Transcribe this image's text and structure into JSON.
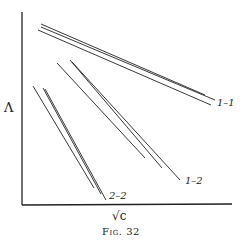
{
  "figure": {
    "caption": "Fig. 32",
    "y_axis_label": "Λ",
    "x_axis_label": "√c"
  },
  "groups": [
    {
      "label": "1–1",
      "lines": [
        [
          41,
          24,
          205,
          95
        ],
        [
          41,
          27,
          215,
          100
        ],
        [
          38,
          30,
          211,
          105
        ]
      ]
    },
    {
      "label": "1–2",
      "lines": [
        [
          57,
          63,
          145,
          158
        ],
        [
          70,
          60,
          162,
          168
        ],
        [
          72,
          62,
          180,
          180
        ]
      ]
    },
    {
      "label": "2–2",
      "lines": [
        [
          33,
          86,
          94,
          188
        ],
        [
          43,
          88,
          101,
          194
        ],
        [
          45,
          89,
          106,
          200
        ]
      ]
    }
  ],
  "colors": {
    "ink": "#222222",
    "background": "#ffffff"
  }
}
